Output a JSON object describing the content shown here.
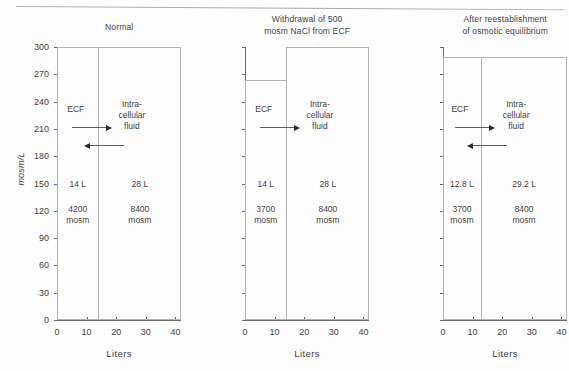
{
  "figure": {
    "background_color": "#fdfdfd",
    "line_color": "#b4b4b4",
    "axis_color": "#6a6a6a",
    "text_color": "#3f3f3f",
    "arrow_color": "#2b2b2b"
  },
  "axes": {
    "ylabel": "mosm/L",
    "xlabel": "Liters",
    "yticks": [
      "0",
      "30",
      "60",
      "90",
      "120",
      "150",
      "180",
      "210",
      "240",
      "270",
      "300"
    ],
    "ytick_values": [
      0,
      30,
      60,
      90,
      120,
      150,
      180,
      210,
      240,
      270,
      300
    ],
    "xticks": [
      "0",
      "10",
      "20",
      "30",
      "40"
    ],
    "xtick_values": [
      0,
      10,
      20,
      30,
      40
    ],
    "ylim": [
      0,
      300
    ],
    "xlim": [
      0,
      42
    ],
    "grid": false
  },
  "panels": [
    {
      "id": "normal",
      "title": "Normal",
      "show_y_axis": true,
      "ecf": {
        "name": "ECF",
        "volume_label": "14 L",
        "osmoles_label": "4200\nmosm",
        "volume": 14,
        "osmolarity": 300,
        "osmoles": 4200
      },
      "icf": {
        "name": "Intra-\ncellular\nfluid",
        "volume_label": "28 L",
        "osmoles_label": "8400\nmosm",
        "volume": 28,
        "osmolarity": 300,
        "osmoles": 8400
      },
      "arrows": [
        {
          "direction": "right",
          "name": "water-flux-arrow-right"
        },
        {
          "direction": "left",
          "name": "water-flux-arrow-left"
        }
      ]
    },
    {
      "id": "withdrawal",
      "title": "Withdrawal of 500\nmosm NaCl from ECF",
      "show_y_axis": false,
      "ecf": {
        "name": "ECF",
        "volume_label": "14 L",
        "osmoles_label": "3700\nmosm",
        "volume": 14,
        "osmolarity": 264,
        "osmoles": 3700
      },
      "icf": {
        "name": "Intra-\ncellular\nfluid",
        "volume_label": "28 L",
        "osmoles_label": "8400\nmosm",
        "volume": 28,
        "osmolarity": 300,
        "osmoles": 8400
      },
      "arrows": [
        {
          "direction": "right",
          "name": "water-flux-arrow-right"
        }
      ]
    },
    {
      "id": "equilibrium",
      "title": "After reestablishment\nof osmotic equilibrium",
      "show_y_axis": false,
      "ecf": {
        "name": "ECF",
        "volume_label": "12.8 L",
        "osmoles_label": "3700\nmosm",
        "volume": 12.8,
        "osmolarity": 289,
        "osmoles": 3700
      },
      "icf": {
        "name": "Intra-\ncellular\nfluid",
        "volume_label": "29.2 L",
        "osmoles_label": "8400\nmosm",
        "volume": 29.2,
        "osmolarity": 289,
        "osmoles": 8400
      },
      "arrows": [
        {
          "direction": "right",
          "name": "water-flux-arrow-right"
        },
        {
          "direction": "left",
          "name": "water-flux-arrow-left"
        }
      ]
    }
  ],
  "chart_data": {
    "type": "bar",
    "xlabel": "Liters",
    "ylabel": "mosm/L",
    "xlim": [
      0,
      42
    ],
    "ylim": [
      0,
      300
    ],
    "grid": false,
    "note": "Darrow-Yannet style diagram: width = volume (liters), height = osmolarity (mosm/L), area = total osmoles",
    "panels": [
      {
        "title": "Normal",
        "categories": [
          "ECF",
          "Intracellular fluid"
        ],
        "widths": [
          14,
          28
        ],
        "values": [
          300,
          300
        ],
        "osmoles": [
          4200,
          8400
        ],
        "annotations": [
          "14 L",
          "4200 mosm",
          "28 L",
          "8400 mosm"
        ]
      },
      {
        "title": "Withdrawal of 500 mosm NaCl from ECF",
        "categories": [
          "ECF",
          "Intracellular fluid"
        ],
        "widths": [
          14,
          28
        ],
        "values": [
          264,
          300
        ],
        "osmoles": [
          3700,
          8400
        ],
        "annotations": [
          "14 L",
          "3700 mosm",
          "28 L",
          "8400 mosm"
        ]
      },
      {
        "title": "After reestablishment of osmotic equilibrium",
        "categories": [
          "ECF",
          "Intracellular fluid"
        ],
        "widths": [
          12.8,
          29.2
        ],
        "values": [
          289,
          289
        ],
        "osmoles": [
          3700,
          8400
        ],
        "annotations": [
          "12.8 L",
          "3700 mosm",
          "29.2 L",
          "8400 mosm"
        ]
      }
    ]
  }
}
